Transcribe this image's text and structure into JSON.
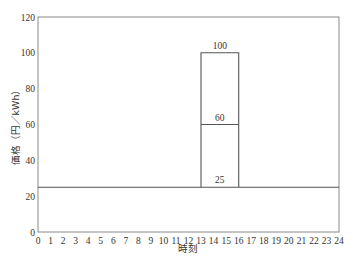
{
  "chart_data": {
    "type": "line",
    "title": "",
    "xlabel": "時刻",
    "ylabel": "価格（円／kWh）",
    "xlim": [
      0,
      24
    ],
    "ylim": [
      0,
      120
    ],
    "x_ticks": [
      0,
      1,
      2,
      3,
      4,
      5,
      6,
      7,
      8,
      9,
      10,
      11,
      12,
      13,
      14,
      15,
      16,
      17,
      18,
      19,
      20,
      21,
      22,
      23,
      24
    ],
    "y_ticks": [
      0,
      20,
      40,
      60,
      80,
      100,
      120
    ],
    "grid": false,
    "legend": null,
    "series": [
      {
        "name": "通常料金",
        "description": "Flat price across the day",
        "x": [
          0,
          24
        ],
        "y": [
          25,
          25
        ]
      },
      {
        "name": "ピーク時間帯価格 60",
        "description": "Peak-time price level between 13 and 16",
        "x": [
          13,
          16
        ],
        "y": [
          60,
          60
        ]
      },
      {
        "name": "ピーク時間帯価格 100",
        "description": "Peak-time price level between 13 and 16 (box outline)",
        "x": [
          13,
          13,
          16,
          16
        ],
        "y": [
          25,
          100,
          100,
          25
        ]
      }
    ],
    "annotations": [
      {
        "text": "100",
        "x": 14.5,
        "y": 100
      },
      {
        "text": "60",
        "x": 14.5,
        "y": 60
      },
      {
        "text": "25",
        "x": 14.5,
        "y": 25
      }
    ],
    "peak_window": {
      "start": 13,
      "end": 16
    }
  },
  "labels": {
    "xlabel": "時刻",
    "ylabel": "価格（円／kWh）",
    "ann_100": "100",
    "ann_60": "60",
    "ann_25": "25"
  }
}
